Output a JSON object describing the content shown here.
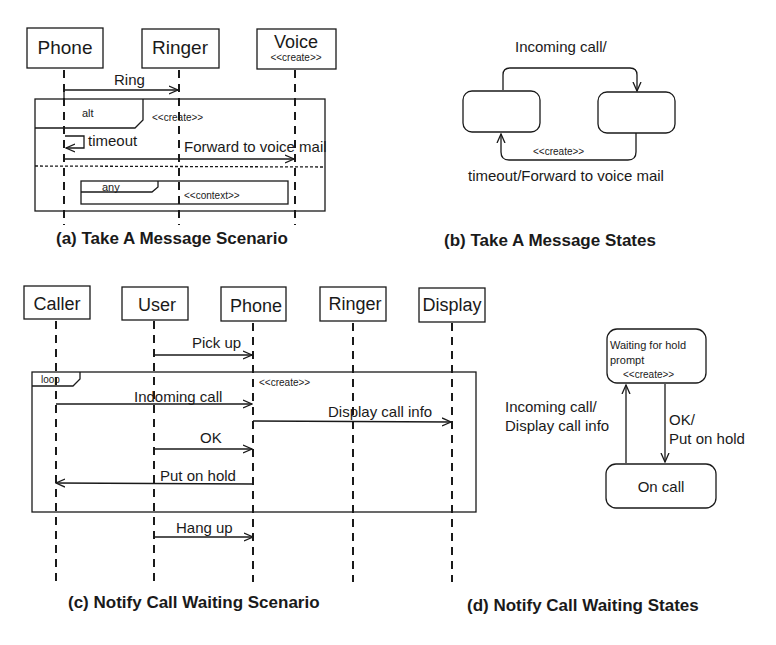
{
  "panel_a": {
    "caption": "(a) Take A Message Scenario",
    "lifelines": [
      {
        "name": "Phone"
      },
      {
        "name": "Ringer"
      },
      {
        "name": "Voice",
        "stereotype": "<<create>>"
      }
    ],
    "messages": [
      {
        "label": "Ring",
        "from": "Phone",
        "to": "Ringer"
      },
      {
        "label": "timeout",
        "from": "Phone",
        "to": "Phone"
      },
      {
        "label": "Forward to voice mail",
        "from": "Phone",
        "to": "Voice"
      }
    ],
    "fragments": [
      {
        "operator": "alt",
        "stereotype": "<<create>>"
      },
      {
        "operator": "any",
        "stereotype": "<<context>>"
      }
    ]
  },
  "panel_b": {
    "caption": "(b) Take A Message States",
    "transitions": [
      {
        "label": "Incoming call/"
      },
      {
        "label": "timeout/Forward to voice mail",
        "stereotype": "<<create>>"
      }
    ]
  },
  "panel_c": {
    "caption": "(c) Notify Call Waiting Scenario",
    "lifelines": [
      {
        "name": "Caller"
      },
      {
        "name": "User"
      },
      {
        "name": "Phone"
      },
      {
        "name": "Ringer"
      },
      {
        "name": "Display"
      }
    ],
    "messages": [
      {
        "label": "Pick up",
        "from": "User",
        "to": "Phone"
      },
      {
        "label": "Indoming call",
        "from": "Caller",
        "to": "Phone"
      },
      {
        "label": "Display call info",
        "from": "Phone",
        "to": "Display"
      },
      {
        "label": "OK",
        "from": "User",
        "to": "Phone"
      },
      {
        "label": "Put on hold",
        "from": "Phone",
        "to": "Caller"
      },
      {
        "label": "Hang up",
        "from": "User",
        "to": "Phone"
      }
    ],
    "fragments": [
      {
        "operator": "loop",
        "stereotype": "<<create>>"
      }
    ]
  },
  "panel_d": {
    "caption": "(d) Notify Call Waiting States",
    "states": [
      {
        "line1": "Waiting for hold",
        "line2": "prompt",
        "stereotype": "<<create>>"
      },
      {
        "name": "On call"
      }
    ],
    "transitions": [
      {
        "line1": "Incoming call/",
        "line2": "Display call info"
      },
      {
        "line1": "OK/",
        "line2": "Put on hold"
      }
    ]
  }
}
